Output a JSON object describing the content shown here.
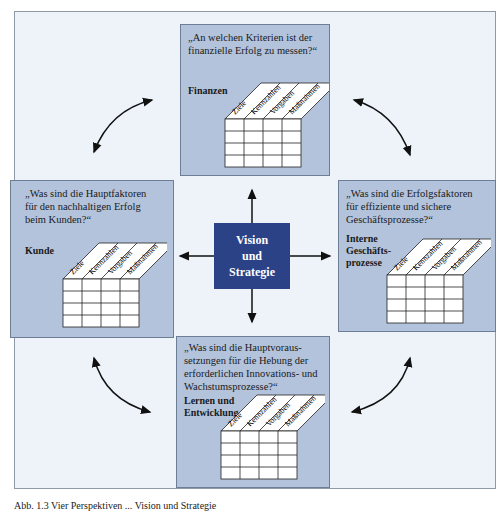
{
  "center": {
    "lines": [
      "Vision",
      "und",
      "Strategie"
    ]
  },
  "table_columns": [
    "Ziele",
    "Kennzahlen",
    "Vorgaben",
    "Maßnahmen"
  ],
  "panels": {
    "finanzen": {
      "question": [
        "„An welchen Kriterien ist der",
        "finanzielle Erfolg zu messen?“"
      ],
      "label": [
        "Finanzen"
      ]
    },
    "kunde": {
      "question": [
        "„Was sind die Hauptfaktoren",
        "für den nachhaltigen Erfolg",
        "beim Kunden?“"
      ],
      "label": [
        "Kunde"
      ]
    },
    "prozesse": {
      "question": [
        "„Was sind die Erfolgsfaktoren",
        "für effiziente und sichere",
        "Geschäftsprozesse?“"
      ],
      "label": [
        "Interne",
        "Geschäfts-",
        "prozesse"
      ]
    },
    "lernen": {
      "question": [
        "„Was sind die Hauptvoraus-",
        "setzungen für die Hebung der",
        "erforderlichen Innovations- und",
        "Wachstumsprozesse?“"
      ],
      "label": [
        "Lernen und",
        "Entwicklung"
      ]
    }
  },
  "colors": {
    "panel": "#b3c3dc",
    "center": "#2b4287",
    "background": "#eef3fa"
  },
  "caption": "Abb. 1.3  Vier Perspektiven ... Vision und Strategie"
}
